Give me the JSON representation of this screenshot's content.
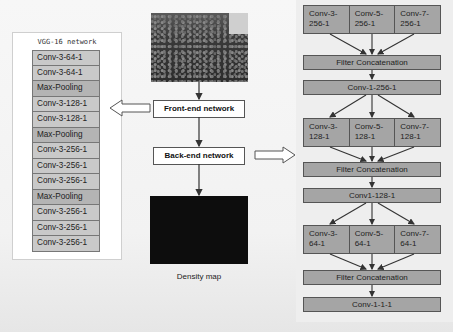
{
  "vgg": {
    "title": "VGG-16 network",
    "layers": [
      {
        "label": "Conv-3-64-1",
        "type": "conv"
      },
      {
        "label": "Conv-3-64-1",
        "type": "conv"
      },
      {
        "label": "Max-Pooling",
        "type": "pool"
      },
      {
        "label": "Conv-3-128-1",
        "type": "conv"
      },
      {
        "label": "Conv-3-128-1",
        "type": "conv"
      },
      {
        "label": "Max-Pooling",
        "type": "pool"
      },
      {
        "label": "Conv-3-256-1",
        "type": "conv"
      },
      {
        "label": "Conv-3-256-1",
        "type": "conv"
      },
      {
        "label": "Conv-3-256-1",
        "type": "conv"
      },
      {
        "label": "Max-Pooling",
        "type": "pool"
      },
      {
        "label": "Conv-3-256-1",
        "type": "conv"
      },
      {
        "label": "Conv-3-256-1",
        "type": "conv"
      },
      {
        "label": "Conv-3-256-1",
        "type": "conv"
      }
    ]
  },
  "pipeline": {
    "input_image": "crowd-photo",
    "front_end": "Front-end network",
    "back_end": "Back-end network",
    "output_label": "Density map"
  },
  "backend": {
    "block1": [
      "Conv-3-\n256-1",
      "Conv-5-\n256-1",
      "Conv-7-\n256-1"
    ],
    "concat1": "Filter Concatenation",
    "conv1": "Conv-1-256-1",
    "block2": [
      "Conv-3-\n128-1",
      "Conv-5-\n128-1",
      "Conv-7-\n128-1"
    ],
    "concat2": "Filter Concatenation",
    "conv2": "Conv1-128-1",
    "block3": [
      "Conv-3-\n64-1",
      "Conv-5-\n64-1",
      "Conv-7-\n64-1"
    ],
    "concat3": "Filter Concatenation",
    "conv3": "Conv-1-1-1"
  },
  "colors": {
    "layer_fill": "#c9c9c9",
    "pool_fill": "#b4b4b4",
    "backend_fill": "#a5a5a5",
    "stroke": "#555555"
  }
}
